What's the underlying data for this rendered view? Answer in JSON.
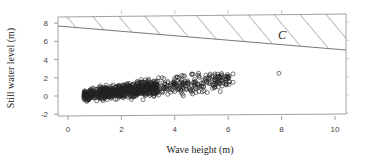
{
  "chart_data": {
    "type": "scatter",
    "title": "",
    "xlabel": "Wave height (m)",
    "ylabel": "Still water level (m)",
    "xlim": [
      -0.3,
      10.4
    ],
    "ylim": [
      -2.1,
      8.4
    ],
    "x_ticks": [
      0,
      2,
      4,
      6,
      8,
      10
    ],
    "y_ticks": [
      -2,
      0,
      2,
      4,
      6,
      8
    ],
    "grid": false,
    "legend": null,
    "marker": "open-circle",
    "region": {
      "label": "C",
      "fill": "hatched",
      "lower_boundary": [
        [
          -0.3,
          7.7
        ],
        [
          10.4,
          5.0
        ]
      ],
      "upper_boundary": [
        [
          -0.3,
          8.2
        ],
        [
          10.4,
          8.5
        ]
      ]
    },
    "scatter_summary": {
      "x_range": [
        0.5,
        8.0
      ],
      "y_range": [
        -1.0,
        2.6
      ],
      "trend": "positive",
      "approx_center": [
        2.5,
        0.6
      ],
      "outliers": [
        [
          5.2,
          2.0
        ],
        [
          5.8,
          1.7
        ],
        [
          7.9,
          2.5
        ]
      ]
    }
  },
  "labels": {
    "x_axis": "Wave height (m)",
    "y_axis": "Still water level (m)",
    "region": "C",
    "x_ticks": [
      "0",
      "2",
      "4",
      "6",
      "8",
      "10"
    ],
    "y_ticks": [
      "8",
      "6",
      "4",
      "2",
      "0",
      "-2"
    ]
  },
  "colors": {
    "axis": "#777777",
    "marker": "#222222",
    "hatch": "#555555"
  }
}
